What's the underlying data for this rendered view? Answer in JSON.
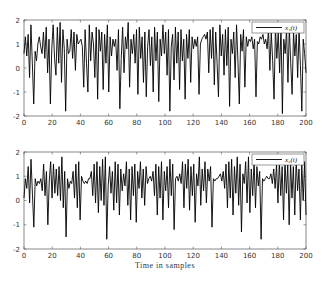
{
  "chart_data": [
    {
      "type": "line",
      "title": "",
      "xlabel": "",
      "ylabel": "",
      "xlim": [
        0,
        200
      ],
      "ylim": [
        -2,
        2
      ],
      "xticks": [
        "0",
        "20",
        "40",
        "60",
        "80",
        "100",
        "120",
        "140",
        "160",
        "180",
        "200"
      ],
      "yticks": [
        "-2",
        "-1",
        "0",
        "1",
        "2"
      ],
      "grid": false,
      "legend_position": "upper right",
      "series": [
        {
          "name": "x1(t)",
          "legend_label": "x₁(t)",
          "color": "#000000",
          "values": [
            0.6,
            1.3,
            0.5,
            1.4,
            -0.4,
            1.8,
            0.2,
            -1.5,
            0.7,
            0.3,
            1.0,
            1.3,
            0.9,
            0.6,
            1.5,
            0.4,
            1.7,
            -0.2,
            1.2,
            -1.5,
            0.8,
            1.8,
            0.4,
            -0.3,
            1.7,
            0.2,
            1.9,
            -0.6,
            1.6,
            0.8,
            -1.8,
            1.2,
            0.6,
            0.7,
            1.6,
            0.4,
            1.5,
            -0.1,
            1.4,
            1.0,
            1.1,
            1.2,
            0.9,
            -0.8,
            1.6,
            0.2,
            -1.0,
            1.8,
            0.3,
            1.5,
            1.0,
            -0.4,
            1.7,
            -1.3,
            1.6,
            0.7,
            1.5,
            -0.9,
            1.4,
            0.2,
            1.8,
            -1.0,
            1.3,
            0.5,
            1.2,
            0.9,
            1.2,
            -0.1,
            1.6,
            -1.7,
            0.4,
            1.7,
            -0.2,
            1.3,
            0.8,
            1.9,
            -0.8,
            1.2,
            0.6,
            1.4,
            0.2,
            1.6,
            -1.1,
            1.7,
            0.4,
            1.3,
            -0.6,
            1.5,
            -1.2,
            0.9,
            1.6,
            0.1,
            1.3,
            -1.0,
            1.7,
            0.3,
            1.5,
            -1.4,
            1.2,
            0.5,
            1.8,
            0.6,
            1.5,
            -0.3,
            1.6,
            -1.8,
            0.9,
            1.4,
            -0.5,
            1.7,
            0.2,
            1.5,
            -0.9,
            1.6,
            0.3,
            1.2,
            -1.3,
            1.4,
            0.4,
            1.6,
            -0.6,
            1.3,
            0.8,
            1.2,
            0.9,
            1.3,
            -1.1,
            1.0,
            1.2,
            1.3,
            1.4,
            1.2,
            1.5,
            -0.2,
            1.6,
            0.4,
            1.7,
            -0.7,
            1.5,
            0.2,
            -1.2,
            1.8,
            0.5,
            1.4,
            -0.3,
            1.6,
            0.1,
            1.7,
            -1.6,
            1.2,
            0.6,
            1.5,
            -0.4,
            1.8,
            0.3,
            -1.5,
            1.4,
            0.7,
            1.6,
            -0.8,
            1.3,
            0.9,
            1.2,
            1.1,
            1.3,
            0.8,
            1.2,
            -1.2,
            1.1,
            1.0,
            1.3,
            1.2,
            1.4,
            1.0,
            1.2,
            0.8,
            1.6,
            -0.1,
            1.5,
            0.3,
            -1.3,
            1.7,
            0.4,
            1.5,
            -0.2,
            1.8,
            -1.9,
            1.2,
            0.6,
            1.6,
            -0.6,
            1.7,
            0.2,
            -1.1,
            1.5,
            0.5,
            1.4,
            -0.4,
            1.6,
            0.1,
            -1.8,
            1.2,
            0.6,
            -0.2
          ]
        }
      ]
    },
    {
      "type": "line",
      "title": "",
      "xlabel": "Time in samples",
      "ylabel": "",
      "xlim": [
        0,
        200
      ],
      "ylim": [
        -2,
        2
      ],
      "xticks": [
        "0",
        "20",
        "40",
        "60",
        "80",
        "100",
        "120",
        "140",
        "160",
        "180",
        "200"
      ],
      "yticks": [
        "-2",
        "-1",
        "0",
        "1",
        "2"
      ],
      "grid": false,
      "legend_position": "upper right",
      "series": [
        {
          "name": "x2(t)",
          "legend_label": "x₂(t)",
          "color": "#000000",
          "values": [
            0.1,
            0.9,
            0.5,
            1.4,
            -0.1,
            1.7,
            0.3,
            -1.1,
            0.9,
            0.6,
            0.8,
            0.7,
            0.9,
            0.4,
            1.5,
            0.2,
            1.2,
            -1.0,
            0.8,
            1.6,
            0.1,
            1.5,
            0.3,
            1.3,
            0.2,
            1.4,
            0.0,
            1.8,
            -0.3,
            1.2,
            -1.5,
            0.9,
            0.5,
            0.8,
            0.7,
            1.2,
            0.1,
            1.5,
            -0.3,
            1.6,
            -0.8,
            1.0,
            0.8,
            0.7,
            0.8,
            0.7,
            0.9,
            0.9,
            1.2,
            0.2,
            1.5,
            -0.1,
            1.6,
            -0.5,
            1.4,
            0.0,
            1.7,
            -0.2,
            1.8,
            -1.6,
            0.6,
            1.4,
            0.3,
            1.2,
            -0.4,
            1.6,
            -0.1,
            1.5,
            -0.6,
            1.3,
            0.4,
            1.1,
            0.6,
            1.6,
            -0.2,
            1.3,
            -0.8,
            1.4,
            0.2,
            1.5,
            -0.9,
            1.2,
            0.5,
            1.6,
            0.1,
            1.3,
            -0.2,
            1.4,
            0.7,
            0.9,
            1.0,
            0.8,
            1.2,
            0.2,
            1.5,
            -0.6,
            1.4,
            0.1,
            1.6,
            -0.8,
            1.2,
            0.4,
            1.4,
            -0.3,
            1.7,
            0.2,
            1.5,
            -1.2,
            0.9,
            1.0,
            0.8,
            1.1,
            0.7,
            1.6,
            -0.3,
            1.5,
            0.5,
            1.7,
            -0.4,
            1.4,
            0.2,
            1.5,
            -0.9,
            1.1,
            0.6,
            1.8,
            -0.2,
            1.3,
            0.4,
            1.6,
            -0.1,
            1.3,
            0.8,
            1.4,
            -1.1,
            0.9,
            0.8,
            0.9,
            0.9,
            1.0,
            1.1,
            0.8,
            1.2,
            0.5,
            1.5,
            -0.3,
            1.6,
            0.1,
            1.7,
            -0.6,
            1.4,
            0.3,
            1.8,
            -0.2,
            1.5,
            -1.3,
            1.1,
            0.7,
            1.6,
            -0.1,
            1.8,
            -0.5,
            1.3,
            0.2,
            1.7,
            -0.3,
            1.4,
            0.6,
            1.2,
            -1.6,
            0.9,
            0.8,
            0.9,
            1.0,
            0.9,
            0.9,
            1.1,
            0.7,
            1.3,
            0.5,
            1.5,
            -0.1,
            1.6,
            0.2,
            1.4,
            -0.8,
            1.7,
            0.3,
            1.5,
            -1.0,
            1.6,
            0.1,
            1.4,
            -0.6,
            1.7,
            0.4,
            1.3,
            -0.8,
            1.5,
            0.0,
            1.6,
            -0.6
          ]
        }
      ]
    }
  ],
  "plots": [
    {
      "legend_label": "x₁(t)"
    },
    {
      "legend_label": "x₂(t)",
      "xlabel": "Time in samples"
    }
  ]
}
